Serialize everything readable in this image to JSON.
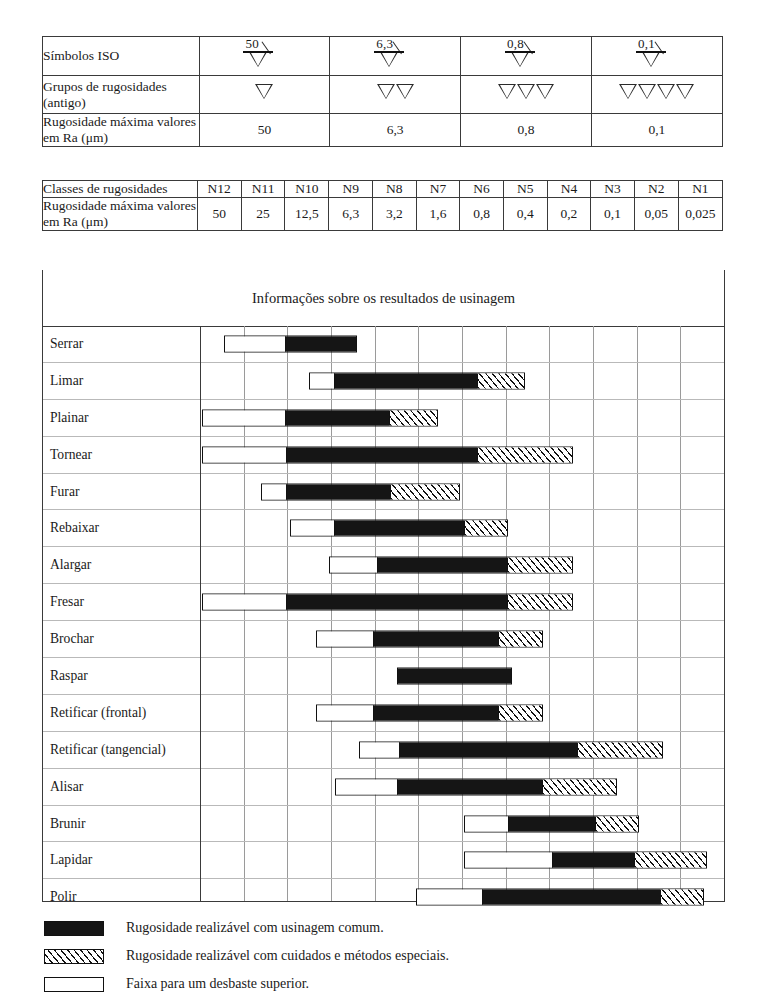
{
  "table": {
    "rows": [
      {
        "label": "Símbolos ISO",
        "type": "iso",
        "values": [
          "50",
          "6,3",
          "0,8",
          "0,1"
        ]
      },
      {
        "label": "Grupos de\nrugosidades (antigo)",
        "type": "triangles",
        "counts": [
          1,
          2,
          3,
          4
        ]
      },
      {
        "label": "Rugosidade máxima\nvalores em Ra (μm)",
        "type": "group-values",
        "values": [
          "50",
          "6,3",
          "0,8",
          "0,1"
        ]
      },
      {
        "label": "Classes de\nrugosidades",
        "type": "classes",
        "values": [
          "N12",
          "N11",
          "N10",
          "N9",
          "N8",
          "N7",
          "N6",
          "N5",
          "N4",
          "N3",
          "N2",
          "N1"
        ]
      },
      {
        "label": "Rugosidade máxima\nvalores em Ra (μm)",
        "type": "ra",
        "values": [
          "50",
          "25",
          "12,5",
          "6,3",
          "3,2",
          "1,6",
          "0,8",
          "0,4",
          "0,2",
          "0,1",
          "0,05",
          "0,025"
        ]
      }
    ]
  },
  "caption": "Informações sobre os resultados de usinagem",
  "legend": [
    {
      "swatch": "black",
      "text": "Rugosidade realizável com usinagem comum."
    },
    {
      "swatch": "hatch",
      "text": "Rugosidade realizável com cuidados e métodos especiais."
    },
    {
      "swatch": "white",
      "text": "Faixa para um desbaste superior."
    }
  ],
  "chart_data": {
    "type": "bar",
    "title": "Informações sobre os resultados de usinagem",
    "xlabel": "Classes de rugosidades (N12 … N1)",
    "ylabel": "Processo de usinagem",
    "grid": true,
    "legend_position": "bottom",
    "axis_classes": [
      "N12",
      "N11",
      "N10",
      "N9",
      "N8",
      "N7",
      "N6",
      "N5",
      "N4",
      "N3",
      "N2",
      "N1"
    ],
    "axis_ra_um": [
      50,
      25,
      12.5,
      6.3,
      3.2,
      1.6,
      0.8,
      0.4,
      0.2,
      0.1,
      0.05,
      0.025
    ],
    "segment_types": {
      "white": "Faixa para um desbaste superior.",
      "black": "Rugosidade realizável com usinagem comum.",
      "hatch": "Rugosidade realizável com cuidados e métodos especiais."
    },
    "categories": [
      "Serrar",
      "Limar",
      "Plainar",
      "Tornear",
      "Furar",
      "Rebaixar",
      "Alargar",
      "Fresar",
      "Brochar",
      "Raspar",
      "Retificar (frontal)",
      "Retificar (tangencial)",
      "Alisar",
      "Brunir",
      "Lapidar",
      "Polir"
    ],
    "bars": [
      {
        "name": "Serrar",
        "segments": [
          {
            "kind": "white",
            "from": 0.55,
            "to": 1.95
          },
          {
            "kind": "black",
            "from": 1.95,
            "to": 3.6
          }
        ]
      },
      {
        "name": "Limar",
        "segments": [
          {
            "kind": "white",
            "from": 2.5,
            "to": 3.05
          },
          {
            "kind": "black",
            "from": 3.05,
            "to": 6.35
          },
          {
            "kind": "hatch",
            "from": 6.35,
            "to": 7.45
          }
        ]
      },
      {
        "name": "Plainar",
        "segments": [
          {
            "kind": "white",
            "from": 0.05,
            "to": 1.95
          },
          {
            "kind": "black",
            "from": 1.95,
            "to": 4.35
          },
          {
            "kind": "hatch",
            "from": 4.35,
            "to": 5.45
          }
        ]
      },
      {
        "name": "Tornear",
        "segments": [
          {
            "kind": "white",
            "from": 0.05,
            "to": 1.95
          },
          {
            "kind": "black",
            "from": 1.95,
            "to": 6.35
          },
          {
            "kind": "hatch",
            "from": 6.35,
            "to": 8.55
          }
        ]
      },
      {
        "name": "Furar",
        "segments": [
          {
            "kind": "white",
            "from": 1.4,
            "to": 1.95
          },
          {
            "kind": "black",
            "from": 1.95,
            "to": 4.35
          },
          {
            "kind": "hatch",
            "from": 4.35,
            "to": 5.95
          }
        ]
      },
      {
        "name": "Rebaixar",
        "segments": [
          {
            "kind": "white",
            "from": 2.05,
            "to": 3.05
          },
          {
            "kind": "black",
            "from": 3.05,
            "to": 6.05
          },
          {
            "kind": "hatch",
            "from": 6.05,
            "to": 7.05
          }
        ]
      },
      {
        "name": "Alargar",
        "segments": [
          {
            "kind": "white",
            "from": 2.95,
            "to": 4.05
          },
          {
            "kind": "black",
            "from": 4.05,
            "to": 7.05
          },
          {
            "kind": "hatch",
            "from": 7.05,
            "to": 8.55
          }
        ]
      },
      {
        "name": "Fresar",
        "segments": [
          {
            "kind": "white",
            "from": 0.05,
            "to": 1.95
          },
          {
            "kind": "black",
            "from": 1.95,
            "to": 7.05
          },
          {
            "kind": "hatch",
            "from": 7.05,
            "to": 8.55
          }
        ]
      },
      {
        "name": "Brochar",
        "segments": [
          {
            "kind": "white",
            "from": 2.65,
            "to": 3.95
          },
          {
            "kind": "black",
            "from": 3.95,
            "to": 6.85
          },
          {
            "kind": "hatch",
            "from": 6.85,
            "to": 7.85
          }
        ]
      },
      {
        "name": "Raspar",
        "segments": [
          {
            "kind": "black",
            "from": 4.5,
            "to": 7.15
          }
        ]
      },
      {
        "name": "Retificar (frontal)",
        "segments": [
          {
            "kind": "white",
            "from": 2.65,
            "to": 3.95
          },
          {
            "kind": "black",
            "from": 3.95,
            "to": 6.85
          },
          {
            "kind": "hatch",
            "from": 6.85,
            "to": 7.85
          }
        ]
      },
      {
        "name": "Retificar (tangencial)",
        "segments": [
          {
            "kind": "white",
            "from": 3.65,
            "to": 4.55
          },
          {
            "kind": "black",
            "from": 4.55,
            "to": 8.65
          },
          {
            "kind": "hatch",
            "from": 8.65,
            "to": 10.6
          }
        ]
      },
      {
        "name": "Alisar",
        "segments": [
          {
            "kind": "white",
            "from": 3.1,
            "to": 4.5
          },
          {
            "kind": "black",
            "from": 4.5,
            "to": 7.85
          },
          {
            "kind": "hatch",
            "from": 7.85,
            "to": 9.55
          }
        ]
      },
      {
        "name": "Brunir",
        "segments": [
          {
            "kind": "white",
            "from": 6.05,
            "to": 7.05
          },
          {
            "kind": "black",
            "from": 7.05,
            "to": 9.05
          },
          {
            "kind": "hatch",
            "from": 9.05,
            "to": 10.05
          }
        ]
      },
      {
        "name": "Lapidar",
        "segments": [
          {
            "kind": "white",
            "from": 6.05,
            "to": 8.05
          },
          {
            "kind": "black",
            "from": 8.05,
            "to": 9.95
          },
          {
            "kind": "hatch",
            "from": 9.95,
            "to": 11.6
          }
        ]
      },
      {
        "name": "Polir",
        "segments": [
          {
            "kind": "white",
            "from": 4.95,
            "to": 6.45
          },
          {
            "kind": "black",
            "from": 6.45,
            "to": 10.55
          },
          {
            "kind": "hatch",
            "from": 10.55,
            "to": 11.55
          }
        ]
      }
    ]
  }
}
